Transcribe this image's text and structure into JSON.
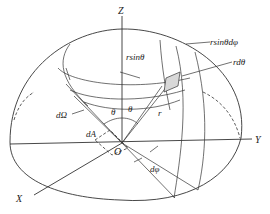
{
  "diagram": {
    "type": "spherical-coordinate-solid-angle",
    "axes": {
      "z": "Z",
      "x": "X",
      "y": "Y",
      "origin": "O"
    },
    "labels": {
      "r_sin_theta": "rsinθ",
      "r_sin_theta_dphi": "rsinθdφ",
      "r_dtheta": "rdθ",
      "d_omega": "dΩ",
      "dA": "dA",
      "theta_left": "θ",
      "theta_right": "θ",
      "r": "r",
      "d_phi": "dφ"
    },
    "colors": {
      "line": "#333333",
      "patch": "#d8d8d8",
      "background": "#ffffff"
    }
  }
}
